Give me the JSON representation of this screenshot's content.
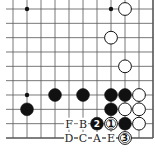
{
  "board": {
    "origin_x": 13,
    "origin_y": 9,
    "spacing_x": 14,
    "spacing_y": 14.333,
    "cols": 11,
    "rows": 10,
    "edges": {
      "right": true,
      "bottom": true,
      "left": false,
      "top": false
    },
    "line_color": "#555555",
    "star_points": [
      [
        1,
        0
      ],
      [
        7,
        0
      ],
      [
        1,
        6
      ]
    ]
  },
  "stones": [
    {
      "color": "white",
      "col": 8,
      "row": 0
    },
    {
      "color": "white",
      "col": 7,
      "row": 2
    },
    {
      "color": "white",
      "col": 8,
      "row": 4
    },
    {
      "color": "black",
      "col": 3,
      "row": 6
    },
    {
      "color": "black",
      "col": 5,
      "row": 6
    },
    {
      "color": "black",
      "col": 7,
      "row": 6
    },
    {
      "color": "black",
      "col": 8,
      "row": 6
    },
    {
      "color": "white",
      "col": 9,
      "row": 6
    },
    {
      "color": "black",
      "col": 1,
      "row": 7
    },
    {
      "color": "black",
      "col": 7,
      "row": 7
    },
    {
      "color": "white",
      "col": 8,
      "row": 7
    },
    {
      "color": "white",
      "col": 9,
      "row": 7
    },
    {
      "color": "black",
      "col": 6,
      "row": 8,
      "number": "2"
    },
    {
      "color": "white",
      "col": 7,
      "row": 8,
      "number": "1"
    },
    {
      "color": "black",
      "col": 8,
      "row": 8
    },
    {
      "color": "white",
      "col": 9,
      "row": 8
    },
    {
      "color": "white",
      "col": 8,
      "row": 9,
      "number": "3"
    }
  ],
  "labels": [
    {
      "text": "F",
      "col": 4,
      "row": 8
    },
    {
      "text": "B",
      "col": 5,
      "row": 8
    },
    {
      "text": "D",
      "col": 4,
      "row": 9
    },
    {
      "text": "C",
      "col": 5,
      "row": 9
    },
    {
      "text": "A",
      "col": 6,
      "row": 9
    },
    {
      "text": "E",
      "col": 7,
      "row": 9
    }
  ]
}
